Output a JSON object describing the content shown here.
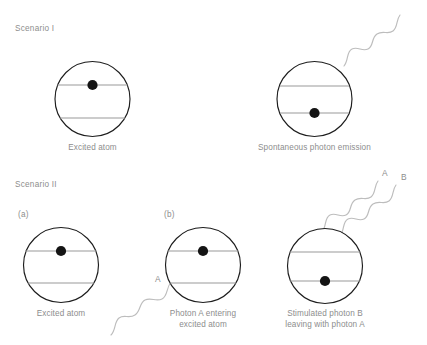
{
  "figure": {
    "title_scenario_1": "Scenario I",
    "title_scenario_2": "Scenario II",
    "background_color": "#ffffff",
    "line_color": "#9a9a9a",
    "circle_stroke_color": "#1d1d1d",
    "electron_color": "#141414",
    "wave_color": "#bdbdbd",
    "text_color": "#8d8d8d"
  },
  "scenario_1": {
    "heading": "Scenario I",
    "panels": [
      {
        "caption": "Excited atom",
        "electron_level": "upper",
        "has_photon": false
      },
      {
        "caption": "Spontaneous photon emission",
        "electron_level": "lower",
        "has_photon": true,
        "photon_count": 1
      }
    ]
  },
  "scenario_2": {
    "heading": "Scenario II",
    "panels": [
      {
        "letter": "(a)",
        "caption": "Excited atom",
        "electron_level": "upper",
        "has_photon": false
      },
      {
        "letter": "(b)",
        "caption_line_1": "Photon A entering",
        "caption_line_2": "excited atom",
        "electron_level": "upper",
        "has_photon": true,
        "photon_labels": [
          "A"
        ]
      },
      {
        "letter": "",
        "caption_line_1": "Stimulated photon B",
        "caption_line_2": "leaving with photon A",
        "electron_level": "lower",
        "has_photon": true,
        "photon_labels": [
          "A",
          "B"
        ]
      }
    ]
  },
  "labels": {
    "photon_a_incoming": "A",
    "photon_a_outgoing": "A",
    "photon_b_outgoing": "B"
  }
}
